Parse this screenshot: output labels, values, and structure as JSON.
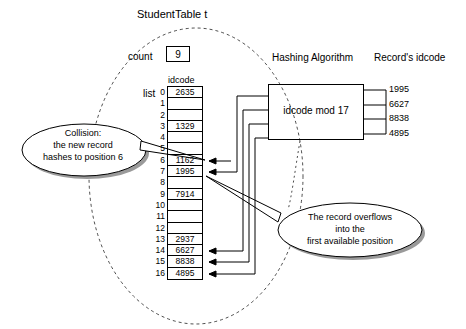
{
  "title": "StudentTable  t",
  "count": {
    "label": "count",
    "value": "9"
  },
  "table": {
    "list_label": "list",
    "column_header": "idcode",
    "rows": [
      {
        "index": "0",
        "value": "2635"
      },
      {
        "index": "1",
        "value": ""
      },
      {
        "index": "2",
        "value": ""
      },
      {
        "index": "3",
        "value": "1329"
      },
      {
        "index": "4",
        "value": ""
      },
      {
        "index": "5",
        "value": ""
      },
      {
        "index": "6",
        "value": "1162"
      },
      {
        "index": "7",
        "value": "1995"
      },
      {
        "index": "8",
        "value": ""
      },
      {
        "index": "9",
        "value": "7914"
      },
      {
        "index": "10",
        "value": ""
      },
      {
        "index": "11",
        "value": ""
      },
      {
        "index": "12",
        "value": ""
      },
      {
        "index": "13",
        "value": "2937"
      },
      {
        "index": "14",
        "value": "6627"
      },
      {
        "index": "15",
        "value": "8838"
      },
      {
        "index": "16",
        "value": "4895"
      }
    ]
  },
  "hashing": {
    "title": "Hashing Algorithm",
    "formula": "idcode mod 17"
  },
  "records": {
    "title": "Record's idcode",
    "values": [
      "1995",
      "6627",
      "8838",
      "4895"
    ]
  },
  "callouts": {
    "collision": "Collision:\nthe new record\nhashes to position 6",
    "collision_lines": [
      "Collision:",
      "the new record",
      "hashes to position 6"
    ],
    "overflow_lines": [
      "The record overflows",
      "into the",
      "first available position"
    ]
  },
  "colors": {
    "stroke": "#000000",
    "background": "#ffffff",
    "shadow": "#9a9a9a"
  }
}
